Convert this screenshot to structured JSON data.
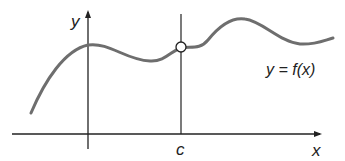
{
  "figure": {
    "type": "function-graph",
    "axes": {
      "x_label": "x",
      "y_label": "y"
    },
    "curve_label": "y = f(x)",
    "point_label": "c",
    "marker": "open-circle",
    "colors": {
      "curve": "#6e6e6e",
      "axes": "#222222",
      "text": "#222222",
      "background": "#ffffff"
    }
  }
}
